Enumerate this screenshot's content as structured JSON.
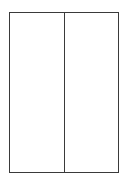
{
  "diagram": {
    "type": "two-panel-rectangle",
    "panels": [
      {
        "id": "left",
        "label": ""
      },
      {
        "id": "right",
        "label": ""
      }
    ],
    "stroke_color": "#3a3a3a",
    "fill_color": "#ffffff"
  }
}
